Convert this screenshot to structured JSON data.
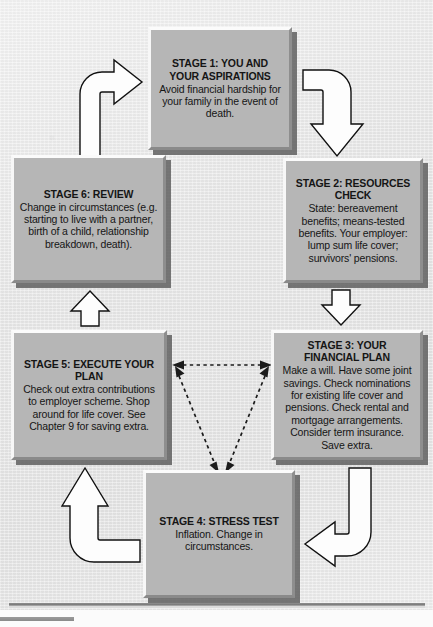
{
  "diagram": {
    "box_fill_color": "#b6b6b6",
    "background_color": "#e9e9e9",
    "arrow_fill_color": "#fdfdfd",
    "arrow_outline_color": "#111111",
    "stages": [
      {
        "id": "stage-1",
        "title": "STAGE 1: YOU AND YOUR ASPIRATIONS",
        "body": "Avoid financial hardship for your family in the event of death."
      },
      {
        "id": "stage-2",
        "title": "STAGE 2: RESOURCES CHECK",
        "body": "State: bereavement benefits; means-tested benefits. Your employer: lump sum life cover; survivors' pensions."
      },
      {
        "id": "stage-3",
        "title": "STAGE 3: YOUR FINANCIAL PLAN",
        "body": "Make a will. Have some joint savings. Check nominations for existing life cover and pensions. Check rental and mortgage arrangements. Consider term insurance. Save extra."
      },
      {
        "id": "stage-4",
        "title": "STAGE 4: STRESS TEST",
        "body": "Inflation. Change in circumstances."
      },
      {
        "id": "stage-5",
        "title": "STAGE 5: EXECUTE YOUR PLAN",
        "body": "Check out extra contributions to employer scheme. Shop around for life cover. See Chapter 9 for saving extra."
      },
      {
        "id": "stage-6",
        "title": "STAGE 6: REVIEW",
        "body": "Change in circumstances (e.g. starting to live with a partner, birth of a child, relationship breakdown, death)."
      }
    ],
    "connectors": [
      {
        "id": "arrow-6-to-1",
        "from": "stage-6",
        "to": "stage-1",
        "style": "solid-block",
        "shape": "curve-up-right"
      },
      {
        "id": "arrow-1-to-2",
        "from": "stage-1",
        "to": "stage-2",
        "style": "solid-block",
        "shape": "curve-right-down"
      },
      {
        "id": "arrow-2-to-3",
        "from": "stage-2",
        "to": "stage-3",
        "style": "solid-block",
        "shape": "down"
      },
      {
        "id": "arrow-3-to-4",
        "from": "stage-3",
        "to": "stage-4",
        "style": "solid-block",
        "shape": "curve-down-left"
      },
      {
        "id": "arrow-4-to-5",
        "from": "stage-4",
        "to": "stage-5",
        "style": "solid-block",
        "shape": "curve-left-up"
      },
      {
        "id": "arrow-5-to-6",
        "from": "stage-5",
        "to": "stage-6",
        "style": "solid-block",
        "shape": "up"
      },
      {
        "id": "dashed-link-5-3",
        "from": "stage-5",
        "to": "stage-3",
        "style": "dashed",
        "shape": "double-headed"
      },
      {
        "id": "dashed-link-5-4",
        "from": "stage-5",
        "to": "stage-4",
        "style": "dashed",
        "shape": "double-headed"
      },
      {
        "id": "dashed-link-3-4",
        "from": "stage-3",
        "to": "stage-4",
        "style": "dashed",
        "shape": "double-headed"
      }
    ]
  }
}
